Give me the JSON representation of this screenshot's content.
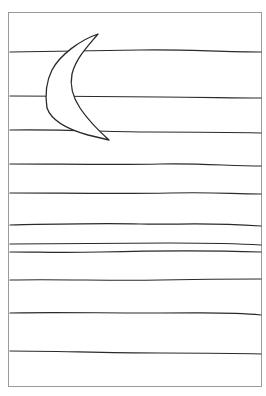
{
  "drawing": {
    "subject": "crescent moon over horizontal lines",
    "colors": {
      "background": "#ffffff",
      "ink": "#2a2a2a",
      "frame": "#9a9a9a"
    },
    "frame": {
      "x": 8,
      "y": 12,
      "width": 254,
      "height": 375
    },
    "lines_y": [
      52,
      97,
      131,
      164,
      193,
      224,
      244,
      252,
      280,
      313,
      351
    ],
    "moon": "crescent-moon"
  }
}
